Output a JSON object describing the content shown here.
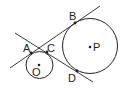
{
  "diagram": {
    "type": "geometry",
    "colors": {
      "stroke": "#222222",
      "background": "#ffffff"
    },
    "circles": [
      {
        "name": "O",
        "cx": 39.5,
        "cy": 65,
        "r": 13.5
      },
      {
        "name": "P",
        "cx": 90,
        "cy": 46,
        "r": 27.5
      }
    ],
    "lines": [
      {
        "name": "AB",
        "x1": 10,
        "y1": 68,
        "x2": 100,
        "y2": 6
      },
      {
        "name": "CD",
        "x1": 15,
        "y1": 33,
        "x2": 93,
        "y2": 82
      }
    ],
    "points": [
      {
        "name": "A",
        "x": 31,
        "y": 53
      },
      {
        "name": "B",
        "x": 75,
        "y": 23
      },
      {
        "name": "C",
        "x": 47,
        "y": 52
      },
      {
        "name": "D",
        "x": 77,
        "y": 71
      },
      {
        "name": "O",
        "x": 39,
        "y": 65
      },
      {
        "name": "P",
        "x": 90,
        "y": 47
      }
    ],
    "labels": {
      "A": "A",
      "B": "B",
      "C": "C",
      "D": "D",
      "O": "O",
      "P": "P"
    }
  }
}
